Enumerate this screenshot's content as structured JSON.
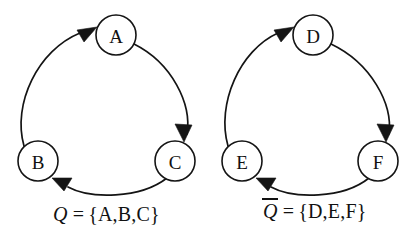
{
  "diagram": {
    "type": "directed-cycle-graphs",
    "background_color": "#ffffff",
    "stroke_color": "#141414",
    "node_fill": "#ffffff",
    "clusters": [
      {
        "id": "cluster-q",
        "label_symbol": "Q",
        "label_overbar": false,
        "label_equals": "=",
        "label_set": "{A,B,C}",
        "label_full": "Q = {A,B,C}",
        "center": {
          "x": 106,
          "y": 112
        },
        "radius": 85,
        "nodes": [
          {
            "id": "A",
            "label": "A",
            "cx": 116,
            "cy": 35,
            "r": 20
          },
          {
            "id": "B",
            "label": "B",
            "cx": 38,
            "cy": 161,
            "r": 20
          },
          {
            "id": "C",
            "label": "C",
            "cx": 175,
            "cy": 161,
            "r": 20
          }
        ],
        "edges": [
          {
            "from": "B",
            "to": "A",
            "direction": "counterclockwise-left-up"
          },
          {
            "from": "A",
            "to": "C",
            "direction": "clockwise-right-down"
          },
          {
            "from": "C",
            "to": "B",
            "direction": "bottom-right-to-left"
          }
        ]
      },
      {
        "id": "cluster-q-bar",
        "label_symbol": "Q",
        "label_overbar": true,
        "label_equals": "=",
        "label_set": "{D,E,F}",
        "label_full": "Q̄ = {D,E,F}",
        "center": {
          "x": 310,
          "y": 112
        },
        "radius": 85,
        "nodes": [
          {
            "id": "D",
            "label": "D",
            "cx": 313,
            "cy": 35,
            "r": 20
          },
          {
            "id": "E",
            "label": "E",
            "cx": 242,
            "cy": 161,
            "r": 20
          },
          {
            "id": "F",
            "label": "F",
            "cx": 378,
            "cy": 161,
            "r": 20
          }
        ],
        "edges": [
          {
            "from": "E",
            "to": "D",
            "direction": "counterclockwise-left-up"
          },
          {
            "from": "D",
            "to": "F",
            "direction": "clockwise-right-down"
          },
          {
            "from": "F",
            "to": "E",
            "direction": "bottom-right-to-left"
          }
        ]
      }
    ]
  },
  "nodes": {
    "A": "A",
    "B": "B",
    "C": "C",
    "D": "D",
    "E": "E",
    "F": "F"
  },
  "labels": {
    "left": {
      "symbol": "Q",
      "equals": "=",
      "set": "{A,B,C}"
    },
    "right": {
      "symbol": "Q",
      "equals": "=",
      "set": "{D,E,F}"
    }
  }
}
